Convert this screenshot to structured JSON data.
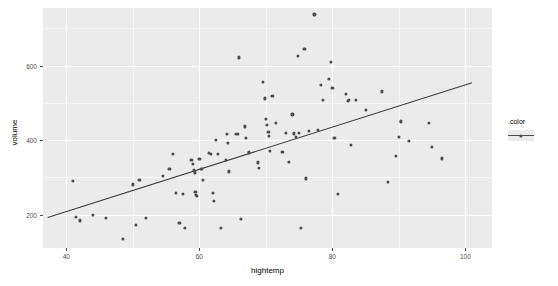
{
  "chart_data": {
    "type": "scatter",
    "title": "",
    "xlabel": "hightemp",
    "ylabel": "volume",
    "xlim": [
      36.5,
      104.0
    ],
    "ylim": [
      110,
      755
    ],
    "xticks": [
      40,
      60,
      80,
      100
    ],
    "yticks": [
      200,
      400,
      600
    ],
    "xtick_labels": [
      "40",
      "60",
      "80",
      "100"
    ],
    "ytick_labels": [
      "200",
      "400",
      "600"
    ],
    "grid": true,
    "grid_major_color": "#ffffff",
    "panel_background": "#ebebeb",
    "point_color": "#4d4d4d",
    "line_color": "#3d3d3d",
    "legend": {
      "title": ".color",
      "position": "right",
      "entries": [
        {
          "label": "",
          "symbol": "point-and-line"
        }
      ]
    },
    "trend_line": {
      "type": "linear-fit",
      "x_start": 37.2,
      "y_start": 192,
      "x_end": 101.0,
      "y_end": 554
    },
    "points": [
      {
        "x": 41.0,
        "y": 290
      },
      {
        "x": 41.5,
        "y": 193
      },
      {
        "x": 42.0,
        "y": 184
      },
      {
        "x": 44.0,
        "y": 200
      },
      {
        "x": 46.0,
        "y": 190
      },
      {
        "x": 48.5,
        "y": 135
      },
      {
        "x": 50.0,
        "y": 281
      },
      {
        "x": 50.5,
        "y": 173
      },
      {
        "x": 51.0,
        "y": 293
      },
      {
        "x": 52.0,
        "y": 190
      },
      {
        "x": 54.5,
        "y": 304
      },
      {
        "x": 55.5,
        "y": 322
      },
      {
        "x": 56.0,
        "y": 362
      },
      {
        "x": 56.5,
        "y": 259
      },
      {
        "x": 57.0,
        "y": 177
      },
      {
        "x": 57.5,
        "y": 256
      },
      {
        "x": 57.8,
        "y": 165
      },
      {
        "x": 58.8,
        "y": 347
      },
      {
        "x": 59.0,
        "y": 337
      },
      {
        "x": 59.2,
        "y": 320
      },
      {
        "x": 59.3,
        "y": 313
      },
      {
        "x": 59.4,
        "y": 260
      },
      {
        "x": 59.5,
        "y": 253
      },
      {
        "x": 59.6,
        "y": 250
      },
      {
        "x": 60.0,
        "y": 349
      },
      {
        "x": 60.3,
        "y": 323
      },
      {
        "x": 60.5,
        "y": 294
      },
      {
        "x": 61.5,
        "y": 365
      },
      {
        "x": 61.8,
        "y": 362
      },
      {
        "x": 62.0,
        "y": 258
      },
      {
        "x": 62.2,
        "y": 236
      },
      {
        "x": 62.5,
        "y": 400
      },
      {
        "x": 62.8,
        "y": 362
      },
      {
        "x": 63.3,
        "y": 165
      },
      {
        "x": 64.0,
        "y": 347
      },
      {
        "x": 64.2,
        "y": 417
      },
      {
        "x": 64.3,
        "y": 393
      },
      {
        "x": 64.5,
        "y": 316
      },
      {
        "x": 65.5,
        "y": 416
      },
      {
        "x": 65.8,
        "y": 417
      },
      {
        "x": 66.0,
        "y": 622
      },
      {
        "x": 66.3,
        "y": 189
      },
      {
        "x": 66.8,
        "y": 437
      },
      {
        "x": 67.0,
        "y": 406
      },
      {
        "x": 67.5,
        "y": 367
      },
      {
        "x": 68.8,
        "y": 340
      },
      {
        "x": 69.0,
        "y": 325
      },
      {
        "x": 69.5,
        "y": 556
      },
      {
        "x": 69.8,
        "y": 512
      },
      {
        "x": 70.0,
        "y": 456
      },
      {
        "x": 70.2,
        "y": 440
      },
      {
        "x": 70.4,
        "y": 421
      },
      {
        "x": 70.5,
        "y": 412
      },
      {
        "x": 70.6,
        "y": 371
      },
      {
        "x": 71.0,
        "y": 518
      },
      {
        "x": 71.5,
        "y": 447
      },
      {
        "x": 72.5,
        "y": 368
      },
      {
        "x": 73.0,
        "y": 419
      },
      {
        "x": 73.5,
        "y": 341
      },
      {
        "x": 74.0,
        "y": 469
      },
      {
        "x": 74.2,
        "y": 418
      },
      {
        "x": 74.5,
        "y": 408
      },
      {
        "x": 74.8,
        "y": 627
      },
      {
        "x": 75.0,
        "y": 419
      },
      {
        "x": 75.3,
        "y": 165
      },
      {
        "x": 75.8,
        "y": 645
      },
      {
        "x": 76.0,
        "y": 297
      },
      {
        "x": 76.5,
        "y": 425
      },
      {
        "x": 77.3,
        "y": 738
      },
      {
        "x": 77.8,
        "y": 427
      },
      {
        "x": 78.3,
        "y": 548
      },
      {
        "x": 78.6,
        "y": 509
      },
      {
        "x": 79.5,
        "y": 565
      },
      {
        "x": 79.8,
        "y": 611
      },
      {
        "x": 80.0,
        "y": 541
      },
      {
        "x": 80.3,
        "y": 406
      },
      {
        "x": 80.8,
        "y": 256
      },
      {
        "x": 82.0,
        "y": 525
      },
      {
        "x": 82.3,
        "y": 505
      },
      {
        "x": 82.5,
        "y": 509
      },
      {
        "x": 82.8,
        "y": 388
      },
      {
        "x": 83.5,
        "y": 507
      },
      {
        "x": 85.0,
        "y": 481
      },
      {
        "x": 87.5,
        "y": 531
      },
      {
        "x": 88.3,
        "y": 288
      },
      {
        "x": 89.5,
        "y": 357
      },
      {
        "x": 90.0,
        "y": 409
      },
      {
        "x": 90.3,
        "y": 450
      },
      {
        "x": 91.5,
        "y": 397
      },
      {
        "x": 94.5,
        "y": 447
      },
      {
        "x": 95.0,
        "y": 382
      },
      {
        "x": 96.5,
        "y": 351
      }
    ]
  }
}
